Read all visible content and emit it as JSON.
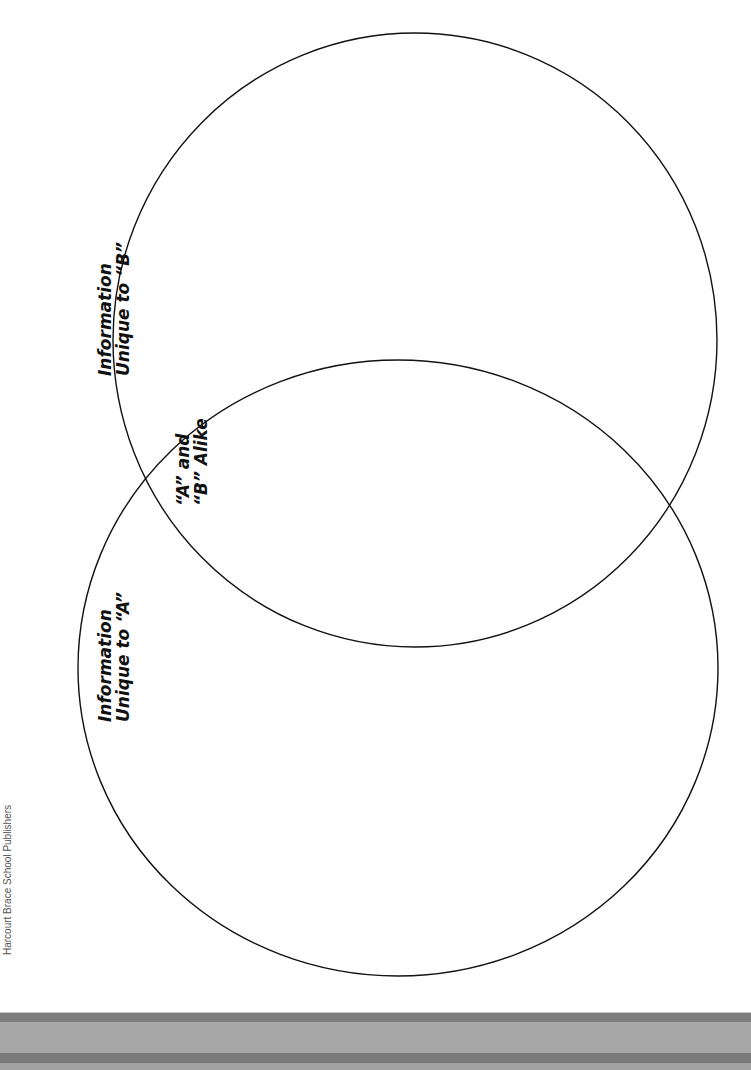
{
  "diagram": {
    "type": "venn",
    "orientation": "rotated-90-ccw",
    "circles": [
      {
        "id": "A",
        "cx": 398,
        "cy": 668,
        "rx": 320,
        "ry": 308
      },
      {
        "id": "B",
        "cx": 415,
        "cy": 340,
        "rx": 302,
        "ry": 307
      }
    ],
    "stroke_color": "#111111",
    "labels": {
      "unique_b": {
        "line1": "Information",
        "line2": "Unique to “B”"
      },
      "alike": {
        "line1": "“A” and",
        "line2": "“B” Alike"
      },
      "unique_a": {
        "line1": "Information",
        "line2": "Unique to “A”"
      }
    }
  },
  "footer": {
    "publisher": "Harcourt Brace School Publishers"
  }
}
